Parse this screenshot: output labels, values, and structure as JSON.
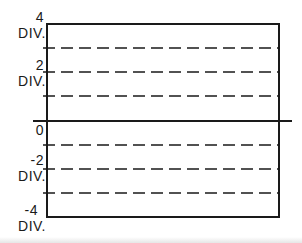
{
  "diagram": {
    "type": "oscilloscope-graticule",
    "labels": {
      "top": {
        "value": "4",
        "unit": "DIV."
      },
      "upper": {
        "value": "2",
        "unit": "DIV."
      },
      "zero": {
        "value": "0"
      },
      "lower": {
        "value": "-2",
        "unit": "DIV."
      },
      "bottom": {
        "value": "-4",
        "unit": "DIV."
      }
    },
    "divisions": {
      "above_zero": 4,
      "below_zero": 4
    },
    "colors": {
      "line": "#1a1a1a",
      "background": "#ffffff"
    }
  }
}
